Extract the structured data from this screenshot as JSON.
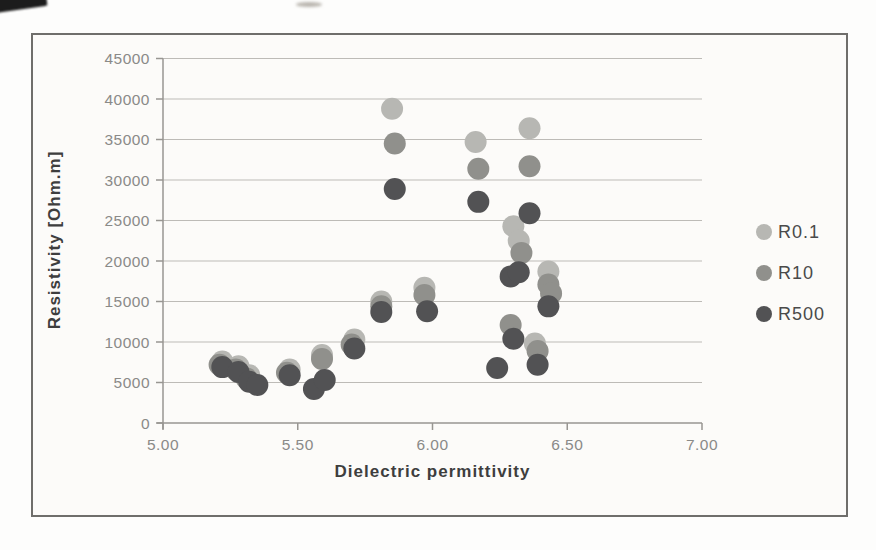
{
  "figure": {
    "page_background": "#fdfdfc",
    "plot_background": "#fcfbf9",
    "frame_border_color": "#6f6e6b",
    "gridline_color": "#bdbbb7",
    "axis_line_color": "#989692",
    "tick_label_color": "#8a8a88",
    "axis_title_color": "#3e3e3e",
    "legend_text_color": "#4a4a4a"
  },
  "chart_data": {
    "type": "scatter",
    "title": "",
    "xlabel": "Dielectric permittivity",
    "ylabel": "Resistivity [Ohm.m]",
    "xlim": [
      5.0,
      7.0
    ],
    "ylim": [
      0,
      45000
    ],
    "x_ticks": [
      "5.00",
      "5.50",
      "6.00",
      "6.50",
      "7.00"
    ],
    "x_tick_values": [
      5.0,
      5.5,
      6.0,
      6.5,
      7.0
    ],
    "y_ticks": [
      "0",
      "5000",
      "10000",
      "15000",
      "20000",
      "25000",
      "30000",
      "35000",
      "40000",
      "45000"
    ],
    "y_tick_values": [
      0,
      5000,
      10000,
      15000,
      20000,
      25000,
      30000,
      35000,
      40000,
      45000
    ],
    "grid": "horizontal",
    "legend_position": "right",
    "marker_radius_px": 11,
    "series": [
      {
        "name": "R0.1",
        "color": "#b7b7b3",
        "points": [
          [
            5.22,
            7600
          ],
          [
            5.28,
            7000
          ],
          [
            5.32,
            5900
          ],
          [
            5.47,
            6600
          ],
          [
            5.59,
            8400
          ],
          [
            5.71,
            10300
          ],
          [
            5.81,
            15000
          ],
          [
            5.85,
            38800
          ],
          [
            5.97,
            16700
          ],
          [
            6.16,
            34700
          ],
          [
            6.3,
            24300
          ],
          [
            6.32,
            22500
          ],
          [
            6.36,
            36400
          ],
          [
            6.38,
            9800
          ],
          [
            6.43,
            18700
          ]
        ]
      },
      {
        "name": "R10",
        "color": "#90908c",
        "points": [
          [
            5.21,
            7200
          ],
          [
            5.27,
            6600
          ],
          [
            5.31,
            5500
          ],
          [
            5.46,
            6200
          ],
          [
            5.59,
            7900
          ],
          [
            5.7,
            9700
          ],
          [
            5.81,
            14400
          ],
          [
            5.86,
            34500
          ],
          [
            5.97,
            15800
          ],
          [
            6.17,
            31400
          ],
          [
            6.29,
            12100
          ],
          [
            6.33,
            21000
          ],
          [
            6.36,
            31700
          ],
          [
            6.39,
            8900
          ],
          [
            6.43,
            17100
          ],
          [
            6.44,
            16000
          ]
        ]
      },
      {
        "name": "R500",
        "color": "#525254",
        "points": [
          [
            5.22,
            6900
          ],
          [
            5.28,
            6300
          ],
          [
            5.32,
            5100
          ],
          [
            5.35,
            4700
          ],
          [
            5.47,
            5900
          ],
          [
            5.56,
            4200
          ],
          [
            5.6,
            5300
          ],
          [
            5.71,
            9200
          ],
          [
            5.81,
            13700
          ],
          [
            5.86,
            28900
          ],
          [
            5.98,
            13800
          ],
          [
            6.17,
            27300
          ],
          [
            6.24,
            6800
          ],
          [
            6.29,
            18100
          ],
          [
            6.3,
            10400
          ],
          [
            6.32,
            18600
          ],
          [
            6.36,
            25900
          ],
          [
            6.39,
            7200
          ],
          [
            6.43,
            14400
          ]
        ]
      }
    ]
  }
}
